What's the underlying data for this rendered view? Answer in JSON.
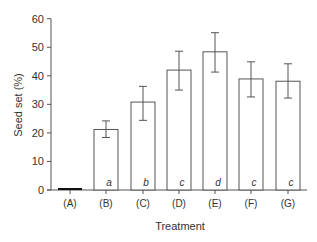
{
  "chart_data": {
    "type": "bar",
    "title": "",
    "xlabel": "Treatment",
    "ylabel": "Seed set (%)",
    "ylim": [
      0,
      60
    ],
    "yticks": [
      0,
      10,
      20,
      30,
      40,
      50,
      60
    ],
    "grid": false,
    "legend": null,
    "categories": [
      "(A)",
      "(B)",
      "(C)",
      "(D)",
      "(E)",
      "(F)",
      "(G)"
    ],
    "values": [
      0.3,
      21.2,
      30.8,
      42.0,
      48.4,
      38.9,
      38.1
    ],
    "error_upper": [
      null,
      24.2,
      36.3,
      48.6,
      55.1,
      44.9,
      44.2
    ],
    "error_lower": [
      null,
      18.4,
      24.4,
      35.0,
      41.3,
      32.6,
      32.2
    ],
    "significance_letters": [
      "",
      "a",
      "b",
      "c",
      "d",
      "c",
      "c"
    ],
    "colors": {
      "bar_fill": "#ffffff",
      "bar_stroke": "#555555",
      "axis": "#555555",
      "bar_a": "#111111"
    }
  }
}
